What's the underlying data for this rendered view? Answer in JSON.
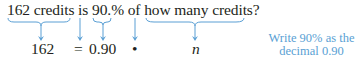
{
  "sentence": {
    "full": "162 credits is 90.% of how many credits?",
    "parts": [
      "162 credits",
      " is ",
      "90.",
      "% of ",
      "how many credits?"
    ]
  },
  "equation": {
    "left": "162",
    "equals": "=",
    "percent_decimal": "0.90",
    "times": "•",
    "unknown": "n"
  },
  "note": {
    "line1": "Write 90% as the",
    "line2": "decimal 0.90"
  },
  "colors": {
    "text": "#231f20",
    "accent": "#5a9fd4"
  }
}
